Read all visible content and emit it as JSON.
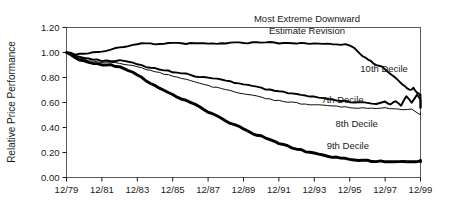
{
  "chart_data": {
    "type": "line",
    "title": "",
    "annotation": "Most Extreme Downward Estimate Revision",
    "annotation_line1": "Most Extreme Downward",
    "annotation_line2": "Estimate Revision",
    "xlabel": "",
    "ylabel": "Relative Price Performance",
    "ylim": [
      0.0,
      1.2
    ],
    "ytick_labels": [
      "0.00",
      "0.20",
      "0.40",
      "0.60",
      "0.80",
      "1.00",
      "1.20"
    ],
    "ytick_values": [
      0.0,
      0.2,
      0.4,
      0.6,
      0.8,
      1.0,
      1.2
    ],
    "xtick_labels": [
      "12/79",
      "12/81",
      "12/83",
      "12/85",
      "12/87",
      "12/89",
      "12/91",
      "12/93",
      "12/95",
      "12/97",
      "12/99"
    ],
    "xtick_values": [
      1979,
      1981,
      1983,
      1985,
      1987,
      1989,
      1991,
      1993,
      1995,
      1997,
      1999
    ],
    "xlim": [
      1979,
      1999
    ],
    "grid": false,
    "legend_position": "inline-labels",
    "line_color": "#000000",
    "series": [
      {
        "name": "10th Decile",
        "label": "10th Decile",
        "stroke_width": 1.9,
        "label_x": 1995.6,
        "label_y": 0.845,
        "x": [
          1979.0,
          1979.5,
          1980.0,
          1980.5,
          1981.0,
          1981.5,
          1982.0,
          1982.5,
          1983.0,
          1983.5,
          1984.0,
          1984.5,
          1985.0,
          1985.5,
          1986.0,
          1986.5,
          1987.0,
          1987.5,
          1988.0,
          1988.5,
          1989.0,
          1989.5,
          1990.0,
          1990.5,
          1991.0,
          1991.5,
          1992.0,
          1992.5,
          1993.0,
          1993.5,
          1994.0,
          1994.5,
          1995.0,
          1995.3,
          1995.6,
          1995.9,
          1996.2,
          1996.5,
          1996.8,
          1997.1,
          1997.4,
          1997.7,
          1998.0,
          1998.2,
          1998.4,
          1998.6,
          1998.8,
          1999.0,
          1999.2,
          1999.4,
          1999.6,
          1999.8,
          2000.0
        ],
        "values": [
          1.0,
          0.985,
          0.99,
          1.0,
          1.01,
          1.025,
          1.04,
          1.05,
          1.065,
          1.075,
          1.065,
          1.07,
          1.075,
          1.07,
          1.075,
          1.07,
          1.075,
          1.07,
          1.075,
          1.08,
          1.075,
          1.08,
          1.075,
          1.08,
          1.075,
          1.075,
          1.07,
          1.075,
          1.07,
          1.065,
          1.07,
          1.065,
          1.06,
          1.035,
          0.99,
          0.955,
          0.93,
          0.9,
          0.885,
          0.855,
          0.82,
          0.78,
          0.745,
          0.715,
          0.7,
          0.715,
          0.68,
          0.655,
          0.63,
          0.665,
          0.61,
          0.64,
          0.555
        ]
      },
      {
        "name": "7th Decile",
        "label": "7th Decile",
        "stroke_width": 1.9,
        "label_x": 1993.4,
        "label_y": 0.595,
        "x": [
          1979.0,
          1979.5,
          1980.0,
          1980.5,
          1981.0,
          1981.5,
          1982.0,
          1982.5,
          1983.0,
          1983.5,
          1984.0,
          1984.5,
          1985.0,
          1985.5,
          1986.0,
          1986.5,
          1987.0,
          1987.5,
          1988.0,
          1988.5,
          1989.0,
          1989.5,
          1990.0,
          1990.5,
          1991.0,
          1991.5,
          1992.0,
          1992.5,
          1993.0,
          1993.5,
          1994.0,
          1994.5,
          1995.0,
          1995.5,
          1996.0,
          1996.5,
          1997.0,
          1997.3,
          1997.6,
          1997.9,
          1998.2,
          1998.5,
          1998.8,
          1999.1,
          1999.4,
          1999.7,
          2000.0
        ],
        "values": [
          1.0,
          0.975,
          0.955,
          0.945,
          0.935,
          0.93,
          0.935,
          0.925,
          0.905,
          0.885,
          0.875,
          0.86,
          0.845,
          0.835,
          0.82,
          0.805,
          0.8,
          0.79,
          0.775,
          0.76,
          0.745,
          0.73,
          0.715,
          0.7,
          0.69,
          0.675,
          0.665,
          0.655,
          0.645,
          0.635,
          0.625,
          0.615,
          0.605,
          0.6,
          0.595,
          0.59,
          0.605,
          0.585,
          0.615,
          0.57,
          0.65,
          0.6,
          0.665,
          0.62,
          0.6,
          0.575,
          0.565
        ]
      },
      {
        "name": "8th Decile",
        "label": "8th Decile",
        "stroke_width": 0.95,
        "label_x": 1994.2,
        "label_y": 0.405,
        "x": [
          1979.0,
          1979.5,
          1980.0,
          1980.5,
          1981.0,
          1981.5,
          1982.0,
          1982.5,
          1983.0,
          1983.5,
          1984.0,
          1984.5,
          1985.0,
          1985.5,
          1986.0,
          1986.5,
          1987.0,
          1987.5,
          1988.0,
          1988.5,
          1989.0,
          1989.5,
          1990.0,
          1990.5,
          1991.0,
          1991.5,
          1992.0,
          1992.5,
          1993.0,
          1993.5,
          1994.0,
          1994.5,
          1995.0,
          1995.5,
          1996.0,
          1996.5,
          1997.0,
          1997.5,
          1998.0,
          1998.5,
          1999.0,
          1999.5,
          2000.0
        ],
        "values": [
          1.0,
          0.965,
          0.945,
          0.93,
          0.925,
          0.92,
          0.915,
          0.9,
          0.885,
          0.865,
          0.845,
          0.83,
          0.81,
          0.79,
          0.775,
          0.755,
          0.735,
          0.72,
          0.7,
          0.685,
          0.67,
          0.655,
          0.64,
          0.625,
          0.615,
          0.605,
          0.595,
          0.585,
          0.58,
          0.575,
          0.57,
          0.565,
          0.56,
          0.555,
          0.555,
          0.55,
          0.555,
          0.55,
          0.545,
          0.545,
          0.5,
          0.515,
          0.515
        ]
      },
      {
        "name": "9th Decile",
        "label": "9th Decile",
        "stroke_width": 2.9,
        "label_x": 1993.7,
        "label_y": 0.225,
        "x": [
          1979.0,
          1979.5,
          1980.0,
          1980.5,
          1981.0,
          1981.5,
          1982.0,
          1982.5,
          1983.0,
          1983.5,
          1984.0,
          1984.5,
          1985.0,
          1985.5,
          1986.0,
          1986.5,
          1987.0,
          1987.5,
          1988.0,
          1988.5,
          1989.0,
          1989.5,
          1990.0,
          1990.5,
          1991.0,
          1991.5,
          1992.0,
          1992.5,
          1993.0,
          1993.5,
          1994.0,
          1994.5,
          1995.0,
          1995.5,
          1996.0,
          1996.5,
          1997.0,
          1997.5,
          1998.0,
          1998.5,
          1999.0,
          1999.5,
          2000.0
        ],
        "values": [
          1.0,
          0.955,
          0.93,
          0.915,
          0.905,
          0.9,
          0.885,
          0.855,
          0.82,
          0.775,
          0.735,
          0.695,
          0.66,
          0.63,
          0.6,
          0.565,
          0.525,
          0.49,
          0.455,
          0.42,
          0.39,
          0.355,
          0.33,
          0.3,
          0.275,
          0.25,
          0.23,
          0.21,
          0.195,
          0.18,
          0.165,
          0.155,
          0.145,
          0.14,
          0.135,
          0.13,
          0.13,
          0.125,
          0.13,
          0.125,
          0.13,
          0.135,
          0.13
        ]
      }
    ]
  }
}
